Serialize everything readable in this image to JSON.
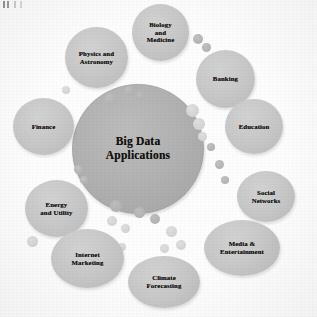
{
  "figure": {
    "title": "Big Data Applications",
    "type": "bubble-cluster-diagram",
    "artifact_label": ""
  },
  "center": {
    "label": "Big Data\nApplications",
    "color": "#b0b0b0"
  },
  "palette": {
    "background": "#fdfdfd",
    "center_fill": "#b0b0b0",
    "satellite_fill": "#c6c6c6",
    "mini_fill": "#cfcfcf",
    "text": "#14120f"
  },
  "satellites": [
    {
      "id": "biology-and-medicine",
      "label": "Biology\nand\nMedicine",
      "x": 132,
      "y": 4,
      "w": 57,
      "h": 57
    },
    {
      "id": "physics-and-astronomy",
      "label": "Physics and\nAstronomy",
      "x": 65,
      "y": 27,
      "w": 63,
      "h": 61
    },
    {
      "id": "banking",
      "label": "Banking",
      "x": 196,
      "y": 50,
      "w": 59,
      "h": 58
    },
    {
      "id": "education",
      "label": "Education",
      "x": 225,
      "y": 99,
      "w": 58,
      "h": 55
    },
    {
      "id": "finance",
      "label": "Finance",
      "x": 13,
      "y": 98,
      "w": 61,
      "h": 57
    },
    {
      "id": "social-networks",
      "label": "Social\nNetworks",
      "x": 237,
      "y": 171,
      "w": 58,
      "h": 51
    },
    {
      "id": "energy-and-utility",
      "label": "Energy\nand Utility",
      "x": 25,
      "y": 180,
      "w": 63,
      "h": 57
    },
    {
      "id": "media-and-entertainment",
      "label": "Media &\nEntertainment",
      "x": 204,
      "y": 220,
      "w": 76,
      "h": 56
    },
    {
      "id": "internet-marketing",
      "label": "Internet\nMarketing",
      "x": 51,
      "y": 229,
      "w": 73,
      "h": 59
    },
    {
      "id": "climate-forecasting",
      "label": "Climate\nForecasting",
      "x": 128,
      "y": 256,
      "w": 72,
      "h": 52
    }
  ],
  "minis": [
    {
      "x": 193,
      "y": 34,
      "d": 10,
      "tone": "dark"
    },
    {
      "x": 202,
      "y": 43,
      "d": 9,
      "tone": "dark"
    },
    {
      "x": 186,
      "y": 104,
      "d": 13,
      "tone": "light"
    },
    {
      "x": 193,
      "y": 118,
      "d": 12,
      "tone": "light"
    },
    {
      "x": 198,
      "y": 132,
      "d": 9,
      "tone": "light"
    },
    {
      "x": 207,
      "y": 143,
      "d": 8,
      "tone": "dark"
    },
    {
      "x": 215,
      "y": 160,
      "d": 9,
      "tone": "dark"
    },
    {
      "x": 221,
      "y": 176,
      "d": 8,
      "tone": "dark"
    },
    {
      "x": 62,
      "y": 86,
      "d": 8,
      "tone": "light"
    },
    {
      "x": 74,
      "y": 165,
      "d": 9,
      "tone": "dark"
    },
    {
      "x": 80,
      "y": 176,
      "d": 8,
      "tone": "dark"
    },
    {
      "x": 104,
      "y": 93,
      "d": 13,
      "tone": "on-center"
    },
    {
      "x": 124,
      "y": 86,
      "d": 10,
      "tone": "on-center"
    },
    {
      "x": 136,
      "y": 92,
      "d": 8,
      "tone": "on-center"
    },
    {
      "x": 110,
      "y": 200,
      "d": 12,
      "tone": "on-center"
    },
    {
      "x": 134,
      "y": 207,
      "d": 11,
      "tone": "on-center"
    },
    {
      "x": 150,
      "y": 214,
      "d": 10,
      "tone": "on-center"
    },
    {
      "x": 107,
      "y": 216,
      "d": 10,
      "tone": "light"
    },
    {
      "x": 121,
      "y": 224,
      "d": 9,
      "tone": "light"
    },
    {
      "x": 166,
      "y": 226,
      "d": 11,
      "tone": "light"
    },
    {
      "x": 176,
      "y": 240,
      "d": 10,
      "tone": "light"
    },
    {
      "x": 160,
      "y": 244,
      "d": 9,
      "tone": "light"
    },
    {
      "x": 96,
      "y": 232,
      "d": 12,
      "tone": "light"
    },
    {
      "x": 88,
      "y": 248,
      "d": 9,
      "tone": "light"
    },
    {
      "x": 27,
      "y": 236,
      "d": 11,
      "tone": "light"
    },
    {
      "x": 118,
      "y": 243,
      "d": 8,
      "tone": "light"
    }
  ]
}
